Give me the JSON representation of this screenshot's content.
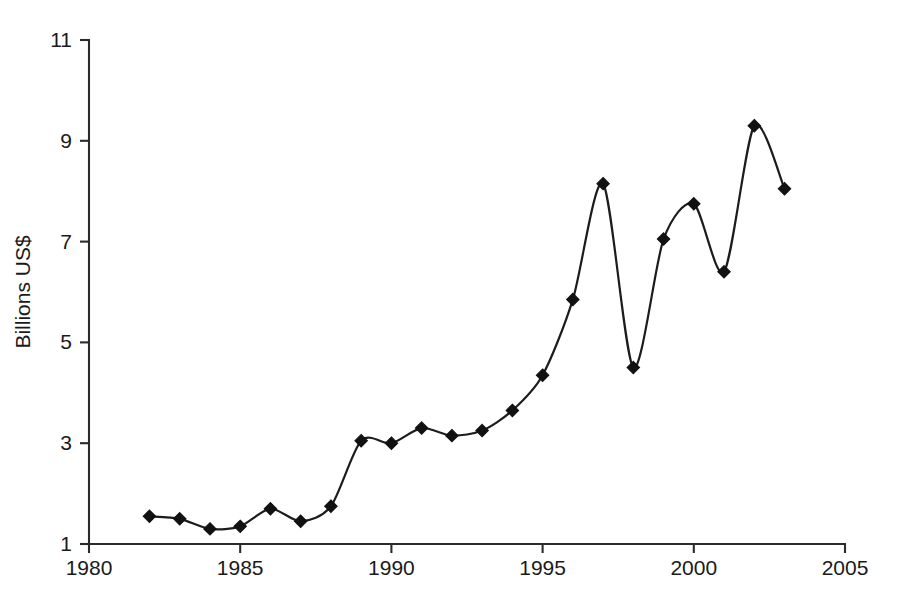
{
  "chart_data": {
    "type": "line",
    "title": "",
    "subtitle": "",
    "xlabel": "",
    "ylabel": "Billions US$",
    "xlim": [
      1980,
      2005
    ],
    "ylim": [
      1,
      11
    ],
    "grid": false,
    "legend": false,
    "legend_position": "none",
    "marker": "diamond",
    "line_color": "#1c1c1c",
    "marker_color": "#111111",
    "background_color": "#ffffff",
    "interpolation": "smooth-spline",
    "x_tick_labels": [
      "1980",
      "1985",
      "1990",
      "1995",
      "2000",
      "2005"
    ],
    "x_ticks": [
      1980,
      1985,
      1990,
      1995,
      2000,
      2005
    ],
    "y_tick_labels": [
      "1",
      "3",
      "5",
      "7",
      "9",
      "11"
    ],
    "y_ticks": [
      1,
      3,
      5,
      7,
      9,
      11
    ],
    "x": [
      1982,
      1983,
      1984,
      1985,
      1986,
      1987,
      1988,
      1989,
      1990,
      1991,
      1992,
      1993,
      1994,
      1995,
      1996,
      1997,
      1998,
      1999,
      2000,
      2001,
      2002,
      2003
    ],
    "values": [
      1.55,
      1.5,
      1.3,
      1.35,
      1.7,
      1.45,
      1.75,
      3.05,
      3.0,
      3.3,
      3.15,
      3.25,
      3.65,
      4.35,
      5.85,
      8.15,
      4.5,
      7.05,
      7.75,
      6.4,
      9.3,
      8.05
    ],
    "series": [
      {
        "name": "Billions US$",
        "values": [
          1.55,
          1.5,
          1.3,
          1.35,
          1.7,
          1.45,
          1.75,
          3.05,
          3.0,
          3.3,
          3.15,
          3.25,
          3.65,
          4.35,
          5.85,
          8.15,
          4.5,
          7.05,
          7.75,
          6.4,
          9.3,
          8.05
        ]
      }
    ]
  }
}
